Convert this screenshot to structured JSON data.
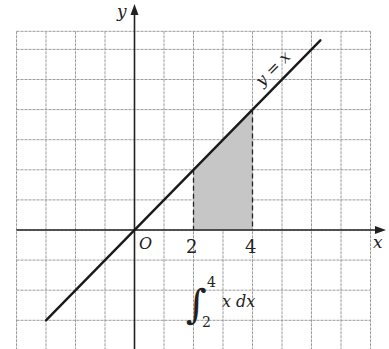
{
  "diagram": {
    "type": "coordinate-plane",
    "grid": {
      "x_min": -4,
      "x_max": 8,
      "y_min": -4,
      "y_max": 7,
      "unit_px_x": 29.5,
      "unit_px_y": 30.1,
      "origin_px": [
        134.5,
        230
      ],
      "grid_color": "#9a9a9a"
    },
    "axes": {
      "x_label": "x",
      "y_label": "y",
      "origin_label": "O"
    },
    "tick_labels": [
      {
        "value": 2,
        "text": "2"
      },
      {
        "value": 4,
        "text": "4"
      }
    ],
    "function": {
      "label": "y = x",
      "x_from": -3,
      "x_to": 6.3,
      "color": "#1a1a1a"
    },
    "shaded_region": {
      "x_from": 2,
      "x_to": 4,
      "under": "y = x",
      "fill": "#c6c6c6",
      "boundary_style": "dashed"
    },
    "integral": {
      "sign": "∫",
      "upper": "4",
      "lower": "2",
      "integrand": "x dx"
    }
  }
}
